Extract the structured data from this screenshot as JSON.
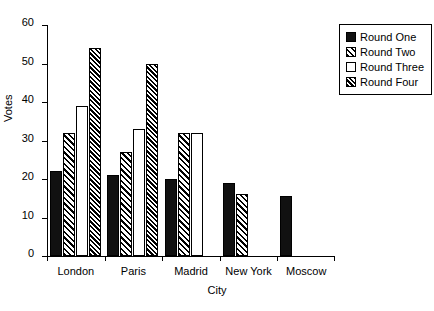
{
  "chart_data": {
    "type": "bar",
    "title": "",
    "xlabel": "City",
    "ylabel": "Votes",
    "categories": [
      "London",
      "Paris",
      "Madrid",
      "New York",
      "Moscow"
    ],
    "series": [
      {
        "name": "Round One",
        "values": [
          22,
          21,
          20,
          19,
          15.5
        ],
        "fill": "solid"
      },
      {
        "name": "Round Two",
        "values": [
          32,
          27,
          32,
          16,
          null
        ],
        "fill": "hatch"
      },
      {
        "name": "Round Three",
        "values": [
          39,
          33,
          32,
          null,
          null
        ],
        "fill": "empty"
      },
      {
        "name": "Round Four",
        "values": [
          54,
          50,
          null,
          null,
          null
        ],
        "fill": "hatch-dense"
      }
    ],
    "ylim": [
      0,
      60
    ],
    "yticks": [
      0,
      10,
      20,
      30,
      40,
      50,
      60
    ],
    "ytick_labels": [
      "0",
      "10",
      "20",
      "30",
      "40",
      "50",
      "60"
    ],
    "grid": false,
    "legend_position": "top-right",
    "colors": {
      "ink": "#000000",
      "background": "#ffffff",
      "solid_fill": "#111111"
    }
  }
}
